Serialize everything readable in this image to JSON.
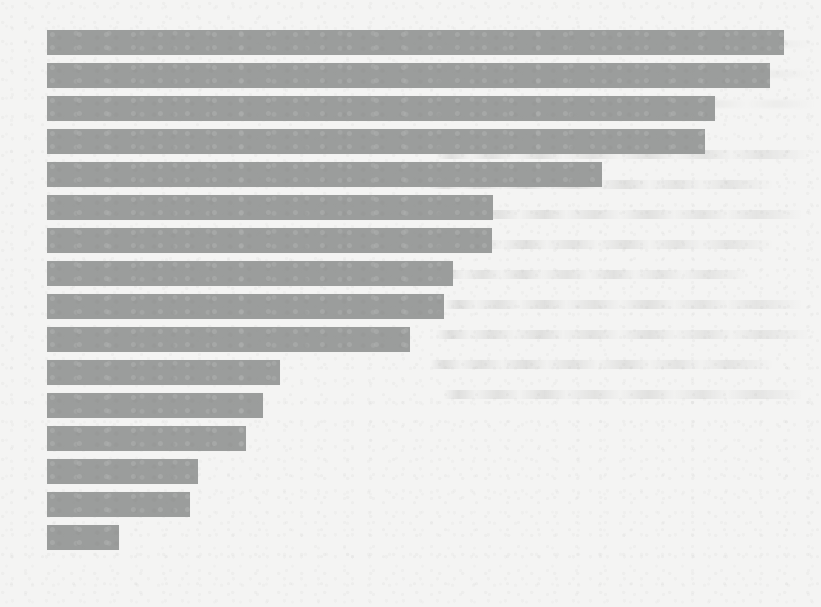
{
  "page": {
    "background_color": "#f4f4f3",
    "width": 821,
    "height": 607,
    "medium": "scanned paper page with bleed-through ghost text",
    "ghost_text_lines": 9,
    "ghost_text_right_lines": 3
  },
  "chart_data": {
    "type": "bar",
    "orientation": "horizontal",
    "title": "",
    "subtitle": "",
    "xlabel": "",
    "ylabel": "",
    "grid": false,
    "legend": false,
    "legend_position": "none",
    "axis_labels_visible": false,
    "tick_labels_visible": false,
    "data_labels_visible": false,
    "bar_color": "#9b9d9c",
    "background_color": "#f4f4f3",
    "categories": [
      "Category 1",
      "Category 2",
      "Category 3",
      "Category 4",
      "Category 5",
      "Category 6",
      "Category 7",
      "Category 8",
      "Category 9",
      "Category 10",
      "Category 11",
      "Category 12",
      "Category 13",
      "Category 14",
      "Category 15",
      "Category 16"
    ],
    "values": [
      100.0,
      98.1,
      90.6,
      89.3,
      75.4,
      60.5,
      60.4,
      55.1,
      53.9,
      49.3,
      31.6,
      29.3,
      27.0,
      20.5,
      19.4,
      9.8
    ],
    "xlim": [
      0,
      100
    ],
    "ylim": null,
    "sorted": "descending",
    "bar_count": 16
  },
  "geometry": {
    "plot_left_px": 47,
    "plot_top_px": 30,
    "bar_height_px": 25,
    "bar_pitch_px": 33,
    "bar_right_edges_px": [
      784,
      770,
      715,
      705,
      602,
      493,
      492,
      453,
      444,
      410,
      280,
      263,
      246,
      198,
      190,
      119
    ],
    "bars": [
      {
        "index": 1,
        "x": 47,
        "y": 30,
        "width": 737,
        "height": 25
      },
      {
        "index": 2,
        "x": 47,
        "y": 63,
        "width": 723,
        "height": 25
      },
      {
        "index": 3,
        "x": 47,
        "y": 96,
        "width": 668,
        "height": 25
      },
      {
        "index": 4,
        "x": 47,
        "y": 129,
        "width": 658,
        "height": 25
      },
      {
        "index": 5,
        "x": 47,
        "y": 162,
        "width": 555,
        "height": 25
      },
      {
        "index": 6,
        "x": 47,
        "y": 195,
        "width": 446,
        "height": 25
      },
      {
        "index": 7,
        "x": 47,
        "y": 228,
        "width": 445,
        "height": 25
      },
      {
        "index": 8,
        "x": 47,
        "y": 261,
        "width": 406,
        "height": 25
      },
      {
        "index": 9,
        "x": 47,
        "y": 294,
        "width": 397,
        "height": 25
      },
      {
        "index": 10,
        "x": 47,
        "y": 327,
        "width": 363,
        "height": 25
      },
      {
        "index": 11,
        "x": 47,
        "y": 360,
        "width": 233,
        "height": 25
      },
      {
        "index": 12,
        "x": 47,
        "y": 393,
        "width": 216,
        "height": 25
      },
      {
        "index": 13,
        "x": 47,
        "y": 426,
        "width": 199,
        "height": 25
      },
      {
        "index": 14,
        "x": 47,
        "y": 459,
        "width": 151,
        "height": 25
      },
      {
        "index": 15,
        "x": 47,
        "y": 492,
        "width": 143,
        "height": 25
      },
      {
        "index": 16,
        "x": 47,
        "y": 525,
        "width": 72,
        "height": 25
      }
    ]
  }
}
